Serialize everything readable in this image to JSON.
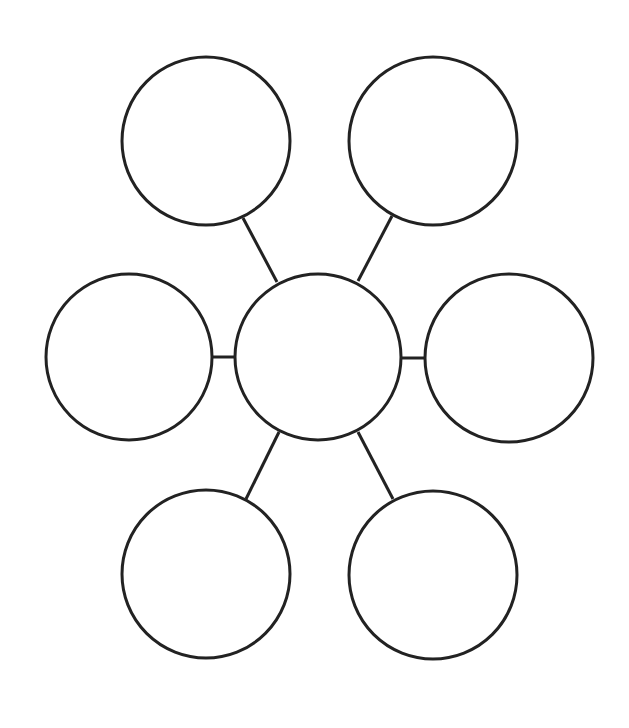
{
  "diagram": {
    "type": "bubble-map",
    "stroke_color": "#222222",
    "fill_color": "#ffffff",
    "background": "#ffffff",
    "stroke_width": 3,
    "center_node": {
      "id": "center",
      "cx": 318,
      "cy": 357,
      "r": 83,
      "label": ""
    },
    "outer_nodes": [
      {
        "id": "top-left",
        "cx": 206,
        "cy": 141,
        "r": 84,
        "label": ""
      },
      {
        "id": "top-right",
        "cx": 433,
        "cy": 141,
        "r": 84,
        "label": ""
      },
      {
        "id": "left",
        "cx": 129,
        "cy": 357,
        "r": 83,
        "label": ""
      },
      {
        "id": "right",
        "cx": 509,
        "cy": 358,
        "r": 84,
        "label": ""
      },
      {
        "id": "bottom-left",
        "cx": 206,
        "cy": 574,
        "r": 84,
        "label": ""
      },
      {
        "id": "bottom-right",
        "cx": 433,
        "cy": 575,
        "r": 84,
        "label": ""
      }
    ],
    "connectors": [
      {
        "id": "top-left",
        "x1": 243,
        "y1": 218,
        "x2": 277,
        "y2": 282
      },
      {
        "id": "top-right",
        "x1": 392,
        "y1": 216,
        "x2": 358,
        "y2": 281
      },
      {
        "id": "left",
        "x1": 212,
        "y1": 357,
        "x2": 235,
        "y2": 357
      },
      {
        "id": "right",
        "x1": 402,
        "y1": 358,
        "x2": 425,
        "y2": 358
      },
      {
        "id": "bottom-left",
        "x1": 279,
        "y1": 432,
        "x2": 246,
        "y2": 499
      },
      {
        "id": "bottom-right",
        "x1": 358,
        "y1": 432,
        "x2": 393,
        "y2": 499
      }
    ]
  }
}
